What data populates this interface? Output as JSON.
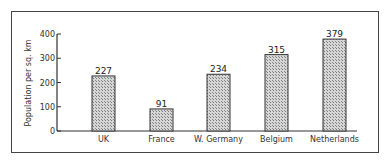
{
  "chart_data": {
    "type": "bar",
    "title": "",
    "xlabel": "",
    "ylabel": "Population per sq. km",
    "categories": [
      "UK",
      "France",
      "W. Germany",
      "Belgium",
      "Netherlands"
    ],
    "values": [
      227,
      91,
      234,
      315,
      379
    ],
    "data_labels": [
      "227",
      "91",
      "234",
      "315",
      "379"
    ],
    "ylim": [
      0,
      400
    ],
    "yticks": [
      0,
      100,
      200,
      300,
      400
    ],
    "grid": false,
    "legend": null,
    "bar_fill": "hatched gray",
    "colors": {
      "bar": "#b8b8b8",
      "axis": "#333333",
      "frame": "#444444"
    }
  }
}
